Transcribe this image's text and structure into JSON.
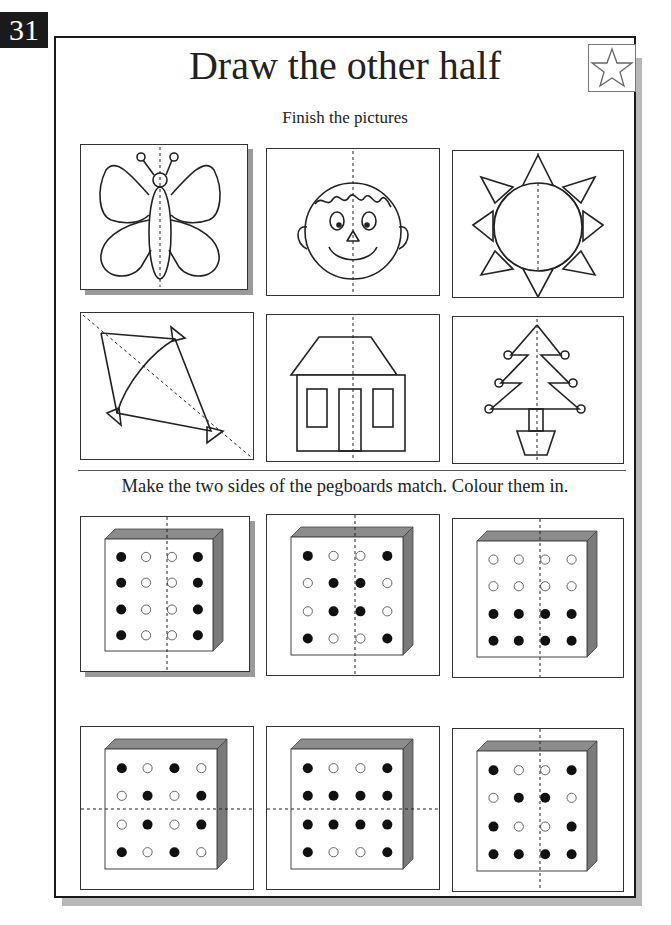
{
  "page_number": "31",
  "title": "Draw the other half",
  "star_icon": "star-icon",
  "section1": {
    "instruction": "Finish the pictures",
    "pictures": [
      {
        "name": "butterfly",
        "fold_line": "vertical"
      },
      {
        "name": "face",
        "fold_line": "vertical"
      },
      {
        "name": "sun",
        "fold_line": "vertical"
      },
      {
        "name": "kite",
        "fold_line": "diagonal"
      },
      {
        "name": "house",
        "fold_line": "vertical"
      },
      {
        "name": "christmas-tree",
        "fold_line": "vertical"
      }
    ]
  },
  "section2": {
    "instruction": "Make the two sides of the pegboards match. Colour them in.",
    "pegboards": [
      {
        "fold_line": "vertical",
        "pegs": [
          [
            1,
            0,
            0,
            1
          ],
          [
            1,
            0,
            0,
            1
          ],
          [
            1,
            0,
            0,
            1
          ],
          [
            1,
            0,
            0,
            1
          ]
        ]
      },
      {
        "fold_line": "vertical",
        "pegs": [
          [
            1,
            0,
            0,
            1
          ],
          [
            0,
            1,
            1,
            0
          ],
          [
            0,
            1,
            1,
            0
          ],
          [
            1,
            0,
            0,
            1
          ]
        ]
      },
      {
        "fold_line": "vertical",
        "pegs": [
          [
            0,
            0,
            0,
            0
          ],
          [
            0,
            0,
            0,
            0
          ],
          [
            1,
            1,
            1,
            1
          ],
          [
            1,
            1,
            1,
            1
          ]
        ]
      },
      {
        "fold_line": "horizontal",
        "pegs": [
          [
            1,
            0,
            1,
            0
          ],
          [
            0,
            1,
            0,
            1
          ],
          [
            0,
            1,
            0,
            1
          ],
          [
            1,
            0,
            1,
            0
          ]
        ]
      },
      {
        "fold_line": "horizontal",
        "pegs": [
          [
            1,
            0,
            0,
            1
          ],
          [
            1,
            1,
            1,
            1
          ],
          [
            1,
            1,
            1,
            1
          ],
          [
            1,
            0,
            0,
            1
          ]
        ]
      },
      {
        "fold_line": "vertical",
        "pegs": [
          [
            1,
            0,
            0,
            1
          ],
          [
            0,
            1,
            1,
            0
          ],
          [
            1,
            0,
            0,
            1
          ],
          [
            1,
            1,
            1,
            1
          ]
        ]
      }
    ]
  },
  "colors": {
    "ink": "#222222",
    "shadow": "#b8b8b8",
    "board_side": "#7a7a7a",
    "board_top": "#8c8c8c"
  }
}
